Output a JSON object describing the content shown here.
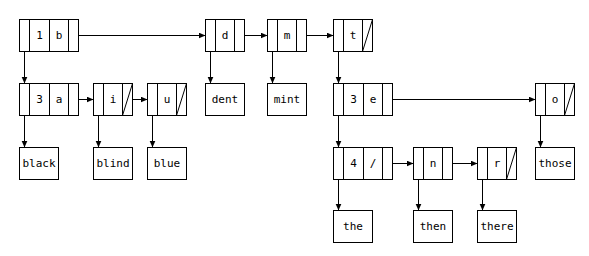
{
  "diagram": {
    "colors": {
      "line": "#000000",
      "background": "#ffffff"
    },
    "nodes": [
      {
        "id": "n1b",
        "type": "node4",
        "x": 19,
        "y": 19,
        "count": "1",
        "char": "b",
        "next_null": false
      },
      {
        "id": "nd",
        "type": "node3",
        "x": 205,
        "y": 19,
        "char": "d",
        "next_null": false
      },
      {
        "id": "nm",
        "type": "node3",
        "x": 267,
        "y": 19,
        "char": "m",
        "next_null": false
      },
      {
        "id": "nt",
        "type": "node3",
        "x": 333,
        "y": 19,
        "char": "t",
        "next_null": true
      },
      {
        "id": "n3a",
        "type": "node4",
        "x": 19,
        "y": 83,
        "count": "3",
        "char": "a",
        "next_null": false
      },
      {
        "id": "ni",
        "type": "node3",
        "x": 93,
        "y": 83,
        "char": "i",
        "next_null": true
      },
      {
        "id": "nu",
        "type": "node3",
        "x": 147,
        "y": 83,
        "char": "u",
        "next_null": true
      },
      {
        "id": "wdent",
        "type": "leaf",
        "x": 205,
        "y": 83,
        "word": "dent"
      },
      {
        "id": "wmint",
        "type": "leaf",
        "x": 267,
        "y": 83,
        "word": "mint"
      },
      {
        "id": "n3e",
        "type": "node4",
        "x": 333,
        "y": 83,
        "count": "3",
        "char": "e",
        "next_null": false
      },
      {
        "id": "no",
        "type": "node3",
        "x": 535,
        "y": 83,
        "char": "o",
        "next_null": true
      },
      {
        "id": "wblack",
        "type": "leaf",
        "x": 19,
        "y": 147,
        "word": "black"
      },
      {
        "id": "wblind",
        "type": "leaf",
        "x": 93,
        "y": 147,
        "word": "blind"
      },
      {
        "id": "wblue",
        "type": "leaf",
        "x": 147,
        "y": 147,
        "word": "blue"
      },
      {
        "id": "n4s",
        "type": "node4",
        "x": 333,
        "y": 147,
        "count": "4",
        "char": "/",
        "next_null": false
      },
      {
        "id": "nn",
        "type": "node3",
        "x": 413,
        "y": 147,
        "char": "n",
        "next_null": false
      },
      {
        "id": "nr",
        "type": "node3",
        "x": 477,
        "y": 147,
        "char": "r",
        "next_null": true
      },
      {
        "id": "wthose",
        "type": "leaf",
        "x": 535,
        "y": 147,
        "word": "those"
      },
      {
        "id": "wthe",
        "type": "leaf",
        "x": 333,
        "y": 210,
        "word": "the"
      },
      {
        "id": "wthen",
        "type": "leaf",
        "x": 413,
        "y": 210,
        "word": "then"
      },
      {
        "id": "wthere",
        "type": "leaf",
        "x": 477,
        "y": 210,
        "word": "there"
      }
    ],
    "edges": [
      {
        "from": "n1b",
        "to": "nd",
        "kind": "next"
      },
      {
        "from": "nd",
        "to": "nm",
        "kind": "next"
      },
      {
        "from": "nm",
        "to": "nt",
        "kind": "next"
      },
      {
        "from": "n3a",
        "to": "ni",
        "kind": "next"
      },
      {
        "from": "ni",
        "to": "nu",
        "kind": "next"
      },
      {
        "from": "n3e",
        "to": "no",
        "kind": "next"
      },
      {
        "from": "n4s",
        "to": "nn",
        "kind": "next"
      },
      {
        "from": "nn",
        "to": "nr",
        "kind": "next"
      },
      {
        "from": "n1b",
        "to": "n3a",
        "kind": "child"
      },
      {
        "from": "n3a",
        "to": "wblack",
        "kind": "child"
      },
      {
        "from": "ni",
        "to": "wblind",
        "kind": "child"
      },
      {
        "from": "nu",
        "to": "wblue",
        "kind": "child"
      },
      {
        "from": "nd",
        "to": "wdent",
        "kind": "child"
      },
      {
        "from": "nm",
        "to": "wmint",
        "kind": "child"
      },
      {
        "from": "nt",
        "to": "n3e",
        "kind": "child"
      },
      {
        "from": "n3e",
        "to": "n4s",
        "kind": "child"
      },
      {
        "from": "no",
        "to": "wthose",
        "kind": "child"
      },
      {
        "from": "n4s",
        "to": "wthe",
        "kind": "child"
      },
      {
        "from": "nn",
        "to": "wthen",
        "kind": "child"
      },
      {
        "from": "nr",
        "to": "wthere",
        "kind": "child"
      }
    ]
  }
}
